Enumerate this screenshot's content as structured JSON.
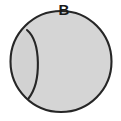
{
  "figure": {
    "type": "geometry-diagram",
    "background_color": "#ffffff",
    "canvas": {
      "width": 121,
      "height": 121
    }
  },
  "labels": [
    {
      "id": "label-b",
      "text": "B",
      "x": 64,
      "y": 11,
      "color": "#1a1a1a",
      "font_size": 15,
      "font_weight": "bold"
    }
  ],
  "shapes": {
    "circle": {
      "name": "main-circle",
      "center_x": 61,
      "center_y": 61.5,
      "radius": 50.5,
      "fill": "#d5d5d5",
      "stroke": "#262626",
      "stroke_width": 2.1
    },
    "dividing_arc": {
      "name": "dividing-arc",
      "start_x": 27,
      "start_y": 30,
      "end_x": 28.5,
      "end_y": 98.5,
      "bulge_peak_x": 41,
      "bulge_peak_y": 62,
      "stroke": "#262626",
      "stroke_width": 2.1,
      "fill": "none",
      "path": "M 27 30 C 41 42, 41.5 82, 28.5 98.5"
    },
    "lune_region": {
      "name": "left-lune-region",
      "fill": "#d2d2d2",
      "path": "M 27 30 C 41 42, 41.5 82, 28.5 98.5 A 50.5 50.5 0 0 1 27 30 Z"
    }
  }
}
